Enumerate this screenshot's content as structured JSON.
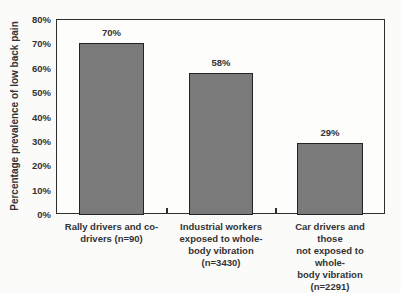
{
  "chart_data": {
    "type": "bar",
    "title": "",
    "xlabel": "",
    "ylabel": "Percentage prevalence of low back pain",
    "ylim": [
      0,
      80
    ],
    "yticks": [
      "0%",
      "10%",
      "20%",
      "30%",
      "40%",
      "50%",
      "60%",
      "70%",
      "80%"
    ],
    "grid": false,
    "legend": null,
    "categories": [
      "Rally drivers and co-drivers (n=90)",
      "Industrial workers exposed to whole-body vibration (n=3430)",
      "Car drivers and those not exposed to whole-body vibration (n=2291)"
    ],
    "category_lines": [
      [
        "Rally drivers and co-",
        "drivers (n=90)"
      ],
      [
        "Industrial workers",
        "exposed to whole-",
        "body vibration",
        "(n=3430)"
      ],
      [
        "Car drivers and those",
        "not exposed to whole-",
        "body vibration",
        "(n=2291)"
      ]
    ],
    "values": [
      70,
      58,
      29
    ],
    "value_labels": [
      "70%",
      "58%",
      "29%"
    ],
    "bar_color": "#7a7a7a"
  }
}
